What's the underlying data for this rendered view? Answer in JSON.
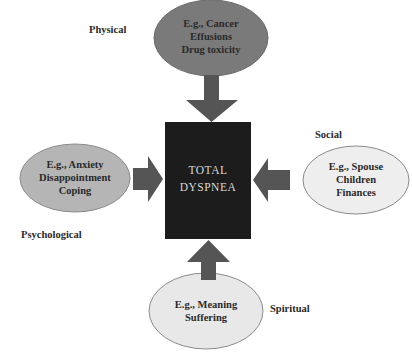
{
  "diagram": {
    "title": "TOTAL DYSPNEA",
    "center": {
      "lines": [
        "TOTAL",
        "DYSPNEA"
      ],
      "fill": "#1c1c1c",
      "text_color": "#d8d8d8"
    },
    "domains": [
      {
        "id": "physical",
        "label": "Physical",
        "lines": [
          "E.g., Cancer",
          "Effusions",
          "Drug toxicity"
        ],
        "fill": "#7a7a7a",
        "position": "top",
        "arrow": "down"
      },
      {
        "id": "psychological",
        "label": "Psychological",
        "lines": [
          "E.g., Anxiety",
          "Disappointment",
          "Coping"
        ],
        "fill": "#b5b5b5",
        "position": "left",
        "arrow": "right"
      },
      {
        "id": "social",
        "label": "Social",
        "lines": [
          "E.g., Spouse",
          "Children",
          "Finances"
        ],
        "fill": "#eeeeee",
        "position": "right",
        "arrow": "left"
      },
      {
        "id": "spiritual",
        "label": "Spiritual",
        "lines": [
          "E.g., Meaning",
          "Suffering"
        ],
        "fill": "#e8e8e8",
        "position": "bottom",
        "arrow": "up"
      }
    ],
    "arrow_color": "#555555",
    "ellipse_stroke": "#777777"
  }
}
